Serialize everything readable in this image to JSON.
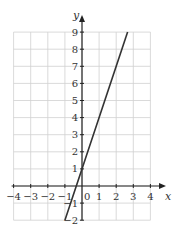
{
  "chart_data": {
    "type": "line",
    "title": "",
    "xlabel": "x",
    "ylabel": "y",
    "xlim": [
      -4,
      4
    ],
    "ylim": [
      -2,
      9
    ],
    "grid": true,
    "x_ticks": [
      "-4",
      "-3",
      "-2",
      "-1",
      "0",
      "1",
      "2",
      "3",
      "4"
    ],
    "y_ticks": [
      "-2",
      "-1",
      "1",
      "2",
      "3",
      "4",
      "5",
      "6",
      "7",
      "8",
      "9"
    ],
    "origin_label": "0",
    "series": [
      {
        "name": "y = 3x + 1",
        "equation": "y = 3x + 1",
        "x": [
          -1,
          2.667
        ],
        "y": [
          -2,
          9
        ]
      }
    ]
  },
  "colors": {
    "grid": "#d0d0d0",
    "axis": "#222222",
    "line": "#333333"
  }
}
